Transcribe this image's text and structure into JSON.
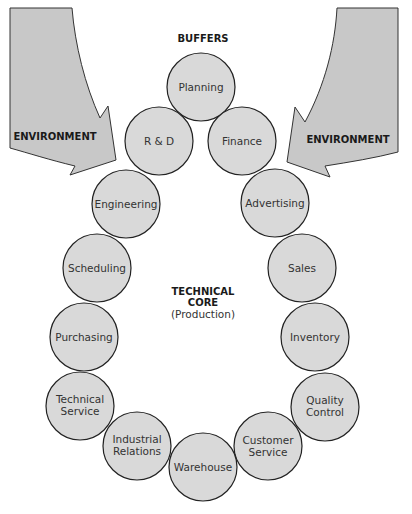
{
  "diagram": {
    "title": "BUFFERS",
    "center": {
      "line1": "TECHNICAL",
      "line2": "CORE",
      "line3": "(Production)"
    },
    "arrows": [
      {
        "label": "ENVIRONMENT",
        "side": "left"
      },
      {
        "label": "ENVIRONMENT",
        "side": "right"
      }
    ],
    "colors": {
      "circle_fill": "#d9d9d9",
      "circle_stroke": "#222222",
      "arrow_fill": "#c8c8c8",
      "arrow_stroke": "#333333"
    },
    "buffers": [
      {
        "lines": [
          "Planning"
        ]
      },
      {
        "lines": [
          "R & D"
        ]
      },
      {
        "lines": [
          "Finance"
        ]
      },
      {
        "lines": [
          "Engineering"
        ]
      },
      {
        "lines": [
          "Advertising"
        ]
      },
      {
        "lines": [
          "Scheduling"
        ]
      },
      {
        "lines": [
          "Sales"
        ]
      },
      {
        "lines": [
          "Purchasing"
        ]
      },
      {
        "lines": [
          "Inventory"
        ]
      },
      {
        "lines": [
          "Technical",
          "Service"
        ]
      },
      {
        "lines": [
          "Quality",
          "Control"
        ]
      },
      {
        "lines": [
          "Industrial",
          "Relations"
        ]
      },
      {
        "lines": [
          "Customer",
          "Service"
        ]
      },
      {
        "lines": [
          "Warehouse"
        ]
      }
    ]
  }
}
